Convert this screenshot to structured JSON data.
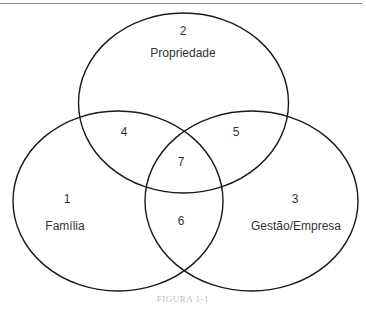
{
  "diagram": {
    "type": "venn",
    "caption": "FIGURA 1-1",
    "circles": [
      {
        "id": "familia",
        "number": "1",
        "label": "Família"
      },
      {
        "id": "propriedade",
        "number": "2",
        "label": "Propriedade"
      },
      {
        "id": "gestao",
        "number": "3",
        "label": "Gestão/Empresa"
      }
    ],
    "intersections": [
      {
        "number": "4",
        "sets": [
          "familia",
          "propriedade"
        ]
      },
      {
        "number": "5",
        "sets": [
          "propriedade",
          "gestao"
        ]
      },
      {
        "number": "6",
        "sets": [
          "familia",
          "gestao"
        ]
      },
      {
        "number": "7",
        "sets": [
          "familia",
          "propriedade",
          "gestao"
        ]
      }
    ],
    "colors": {
      "stroke": "#1a1a1a",
      "text": "#333333",
      "caption": "#bbbbbb",
      "rule": "#888888"
    }
  }
}
